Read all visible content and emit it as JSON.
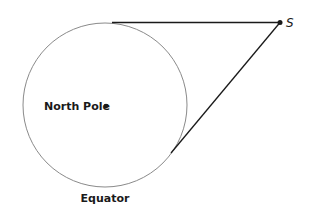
{
  "diagram": {
    "labels": {
      "center": "North Pole",
      "circle": "Equator",
      "point": "S"
    },
    "colors": {
      "circle_stroke": "#808080",
      "line_stroke": "#1a1a1a",
      "text": "#1a1a1a"
    }
  }
}
